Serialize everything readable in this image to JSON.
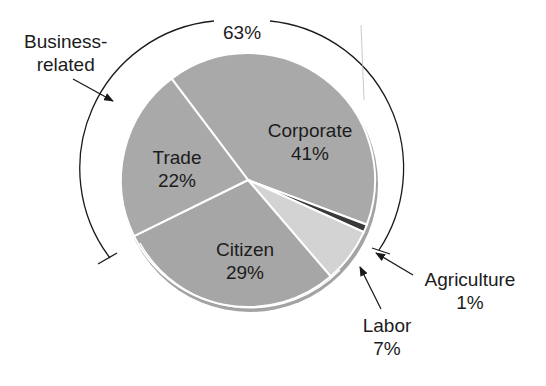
{
  "chart_data": {
    "type": "pie",
    "title": "",
    "slices": [
      {
        "label": "Corporate",
        "value": 41,
        "value_label": "41%",
        "color": "#a9a9a9"
      },
      {
        "label": "Agriculture",
        "value": 1,
        "value_label": "1%",
        "color": "#3a3a3a"
      },
      {
        "label": "Labor",
        "value": 7,
        "value_label": "7%",
        "color": "#d3d3d3"
      },
      {
        "label": "Citizen",
        "value": 29,
        "value_label": "29%",
        "color": "#a6a6a6"
      },
      {
        "label": "Trade",
        "value": 22,
        "value_label": "22%",
        "color": "#a9a9a9"
      }
    ],
    "group_annotation": {
      "label": "Business-related",
      "label_line1": "Business-",
      "label_line2": "related",
      "value": 63,
      "value_label": "63%",
      "members": [
        "Corporate",
        "Agriculture",
        "Trade"
      ]
    },
    "legend": "none (direct labels)"
  },
  "labels": {
    "corporate": {
      "name": "Corporate",
      "pct": "41%"
    },
    "trade": {
      "name": "Trade",
      "pct": "22%"
    },
    "citizen": {
      "name": "Citizen",
      "pct": "29%"
    },
    "labor": {
      "name": "Labor",
      "pct": "7%"
    },
    "agriculture": {
      "name": "Agriculture",
      "pct": "1%"
    },
    "business": {
      "line1": "Business-",
      "line2": "related",
      "pct": "63%"
    }
  }
}
